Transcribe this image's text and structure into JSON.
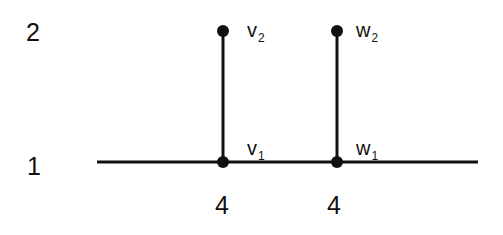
{
  "diagram": {
    "type": "graph",
    "colors": {
      "line": "#111111",
      "node": "#111111",
      "text": "#111111",
      "background": "#ffffff"
    },
    "level_labels": [
      {
        "id": "level-2",
        "text": "2",
        "x": 26,
        "y": 20
      },
      {
        "id": "level-1",
        "text": "1",
        "x": 27,
        "y": 154
      }
    ],
    "baseline": {
      "x1": 97,
      "y1": 162,
      "x2": 478,
      "y2": 162
    },
    "edges": [
      {
        "from": "v1",
        "to": "v2",
        "x1": 223,
        "y1": 162,
        "x2": 223,
        "y2": 31
      },
      {
        "from": "w1",
        "to": "w2",
        "x1": 337,
        "y1": 162,
        "x2": 337,
        "y2": 31
      }
    ],
    "nodes": [
      {
        "id": "v2",
        "name": "v",
        "sub": "2",
        "cx": 223,
        "cy": 31,
        "label_x": 247,
        "label_y": 20
      },
      {
        "id": "v1",
        "name": "v",
        "sub": "1",
        "cx": 223,
        "cy": 162,
        "label_x": 247,
        "label_y": 138
      },
      {
        "id": "w2",
        "name": "w",
        "sub": "2",
        "cx": 337,
        "cy": 31,
        "label_x": 356,
        "label_y": 20
      },
      {
        "id": "w1",
        "name": "w",
        "sub": "1",
        "cx": 337,
        "cy": 162,
        "label_x": 356,
        "label_y": 138
      }
    ],
    "bottom_labels": [
      {
        "id": "count-v",
        "text": "4",
        "x": 215,
        "y": 193
      },
      {
        "id": "count-w",
        "text": "4",
        "x": 327,
        "y": 193
      }
    ]
  }
}
